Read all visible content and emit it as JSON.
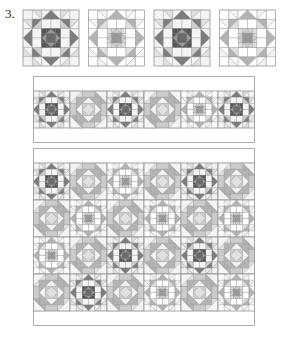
{
  "figure": {
    "number": "3.",
    "type": "quilt-pattern-diagram",
    "background": "#ffffff"
  },
  "palette": {
    "white": "#ffffff",
    "near_white": "#f4f4f4",
    "light": "#e0e0e0",
    "light_mid": "#cccccc",
    "mid": "#b3b3b3",
    "mid_dark": "#999999",
    "dark": "#7d7d7d",
    "darker": "#6a6a6a",
    "darkest": "#555555",
    "line": "#8a8a8a",
    "border": "#9a9a9a"
  },
  "block_types": {
    "star_dark": {
      "name": "star-block-dark",
      "description": "Eight-pointed sawtooth star with dark center and dark points",
      "center": "#555555",
      "points": "#7d7d7d",
      "field": "#cccccc",
      "corner": "#e0e0e0"
    },
    "star_light": {
      "name": "star-block-light",
      "description": "Eight-pointed sawtooth star with light center and mid points",
      "center": "#e0e0e0",
      "points": "#999999",
      "field": "#e0e0e0",
      "corner": "#f4f4f4"
    },
    "diamond": {
      "name": "diamond-block",
      "description": "Square-in-square diamond alternate block",
      "center": "#e0e0e0",
      "ring": "#b3b3b3",
      "corner": "#cccccc"
    }
  },
  "sections": [
    {
      "name": "block-row",
      "label": "Four individual blocks",
      "x": 22,
      "y": 8,
      "width": 259,
      "height": 62,
      "blocks": [
        "star_dark",
        "star_light",
        "star_dark",
        "star_light"
      ]
    },
    {
      "name": "strip-row",
      "label": "Single block strip",
      "x": 33,
      "y": 76,
      "width": 222,
      "height": 67,
      "columns": 6,
      "rows": 1,
      "blocks": [
        "star_dark",
        "diamond",
        "star_dark",
        "diamond",
        "star_light",
        "star_dark"
      ]
    },
    {
      "name": "full-quilt",
      "label": "Full quilt layout",
      "x": 33,
      "y": 148,
      "width": 222,
      "height": 178,
      "columns": 6,
      "rows": 4,
      "layout": [
        [
          "star_dark",
          "diamond",
          "star_light",
          "diamond",
          "star_dark",
          "diamond"
        ],
        [
          "diamond",
          "star_light",
          "diamond",
          "star_light",
          "diamond",
          "star_light"
        ],
        [
          "star_light",
          "diamond",
          "star_dark",
          "diamond",
          "star_dark",
          "diamond"
        ],
        [
          "diamond",
          "star_dark",
          "diamond",
          "star_light",
          "diamond",
          "star_light"
        ]
      ]
    }
  ],
  "chart_data": {
    "type": "table",
    "categories": [
      "col1",
      "col2",
      "col3",
      "col4",
      "col5",
      "col6"
    ],
    "series": [
      {
        "name": "row1",
        "values": [
          "star_dark",
          "diamond",
          "star_light",
          "diamond",
          "star_dark",
          "diamond"
        ]
      },
      {
        "name": "row2",
        "values": [
          "diamond",
          "star_light",
          "diamond",
          "star_light",
          "diamond",
          "star_light"
        ]
      },
      {
        "name": "row3",
        "values": [
          "star_light",
          "diamond",
          "star_dark",
          "diamond",
          "star_dark",
          "diamond"
        ]
      },
      {
        "name": "row4",
        "values": [
          "diamond",
          "star_dark",
          "diamond",
          "star_light",
          "diamond",
          "star_light"
        ]
      }
    ]
  }
}
